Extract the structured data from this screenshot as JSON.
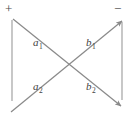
{
  "figure": {
    "stroke_color": "#8a8a8a",
    "label_color": "#3f3f3f",
    "background": "#ffffff",
    "polarity": {
      "plus": "+",
      "minus": "−"
    },
    "labels": {
      "a1": {
        "base": "a",
        "sub": "1"
      },
      "b1": {
        "base": "b",
        "sub": "1"
      },
      "a2": {
        "base": "a",
        "sub": "2"
      },
      "b2": {
        "base": "b",
        "sub": "2"
      }
    },
    "lines": {
      "left_vertical": {
        "x1": 12,
        "y1": 20,
        "x2": 12,
        "y2": 101
      },
      "right_vertical": {
        "x1": 122,
        "y1": 22,
        "x2": 122,
        "y2": 100
      },
      "diag_down": {
        "x1": 13,
        "y1": 19,
        "x2": 123,
        "y2": 108,
        "arrow": "end"
      },
      "diag_up": {
        "x1": 11,
        "y1": 112,
        "x2": 124,
        "y2": 19,
        "arrow": "end"
      }
    }
  }
}
